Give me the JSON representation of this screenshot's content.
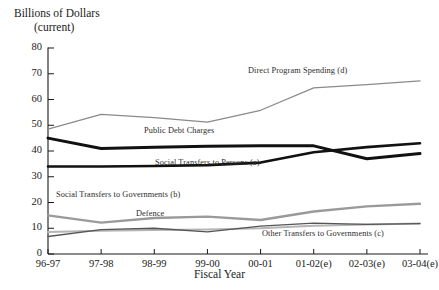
{
  "chart_data": {
    "type": "line",
    "title": "Billions of Dollars",
    "subtitle": "(current)",
    "xlabel": "Fiscal Year",
    "ylabel": "Billions of Dollars (current)",
    "ylim": [
      0,
      80
    ],
    "yticks": [
      0,
      10,
      20,
      30,
      40,
      50,
      60,
      70,
      80
    ],
    "grid": false,
    "legend": "inline-labels",
    "categories": [
      "96-97",
      "97-98",
      "98-99",
      "99-00",
      "00-01",
      "01-02(e)",
      "02-03(e)",
      "03-04(e)"
    ],
    "series": [
      {
        "name": "Direct Program Spending (d)",
        "color": "#8a8a8a",
        "width": 1.2,
        "values": [
          48.5,
          54.2,
          53.0,
          51.2,
          55.8,
          64.5,
          65.8,
          67.2
        ]
      },
      {
        "name": "Public Debt Charges",
        "color": "#111111",
        "width": 3.0,
        "values": [
          45.0,
          41.0,
          41.5,
          41.8,
          42.0,
          42.0,
          37.0,
          39.0
        ]
      },
      {
        "name": "Social Transfers to Persons (a)",
        "color": "#111111",
        "width": 2.6,
        "values": [
          34.0,
          34.0,
          34.2,
          34.5,
          35.5,
          39.5,
          41.5,
          43.0
        ]
      },
      {
        "name": "Social Transfers to Governments (b)",
        "color": "#9a9a9a",
        "width": 2.4,
        "values": [
          15.0,
          12.2,
          14.0,
          14.5,
          13.2,
          16.5,
          18.5,
          19.5
        ]
      },
      {
        "name": "Defence",
        "color": "#b5b5b5",
        "width": 2.0,
        "values": [
          8.5,
          9.0,
          9.3,
          9.5,
          10.0,
          11.0,
          11.5,
          11.8
        ]
      },
      {
        "name": "Other Transfers to Governments (c)",
        "color": "#555555",
        "width": 1.3,
        "values": [
          6.8,
          9.5,
          10.0,
          8.6,
          10.8,
          12.0,
          11.5,
          11.8
        ]
      }
    ],
    "annotations": [
      {
        "text": "Direct Program Spending (d)",
        "x": 248,
        "y": 66
      },
      {
        "text": "Public Debt Charges",
        "x": 144,
        "y": 126
      },
      {
        "text": "Social Transfers to Persons (a)",
        "x": 155,
        "y": 158
      },
      {
        "text": "Social Transfers to Governments (b)",
        "x": 56,
        "y": 190
      },
      {
        "text": "Defence",
        "x": 136,
        "y": 209
      },
      {
        "text": "Other Transfers to Governments (c)",
        "x": 262,
        "y": 229
      }
    ]
  }
}
